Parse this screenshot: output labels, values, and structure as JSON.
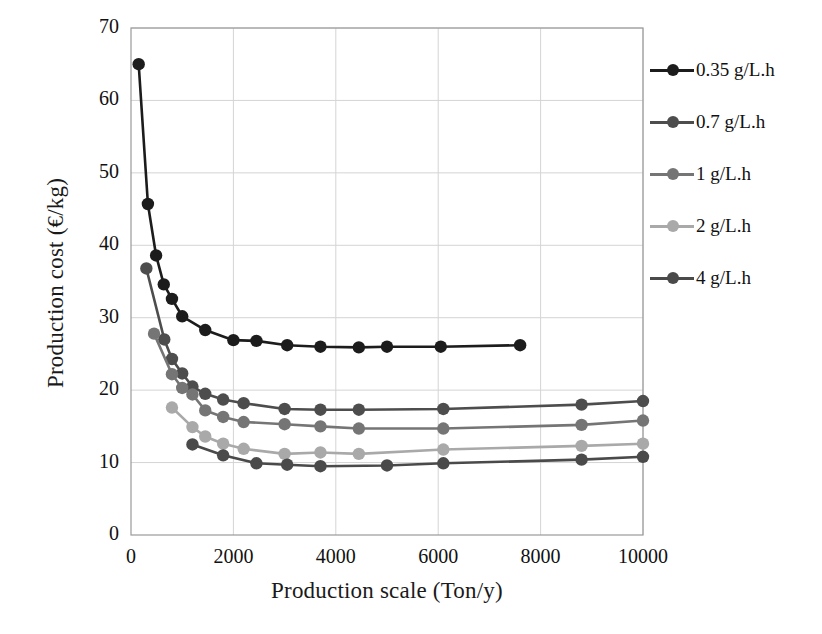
{
  "chart_data": {
    "type": "line",
    "title": "",
    "xlabel": "Production scale (Ton/y)",
    "ylabel": "Production cost (€/kg)",
    "xlim": [
      0,
      10000
    ],
    "ylim": [
      0,
      70
    ],
    "xticks": [
      0,
      2000,
      4000,
      6000,
      8000,
      10000
    ],
    "yticks": [
      0,
      10,
      20,
      30,
      40,
      50,
      60,
      70
    ],
    "grid": true,
    "legend_position": "right",
    "series": [
      {
        "name": "0.35 g/L.h",
        "color": "#1c1c1c",
        "x": [
          150,
          330,
          490,
          640,
          800,
          1000,
          1450,
          2000,
          2450,
          3050,
          3700,
          4450,
          5000,
          6050,
          7600
        ],
        "y": [
          65.0,
          45.7,
          38.6,
          34.6,
          32.6,
          30.2,
          28.3,
          26.9,
          26.8,
          26.2,
          26.0,
          25.9,
          26.0,
          26.0,
          26.2
        ]
      },
      {
        "name": "0.7 g/L.h",
        "color": "#4d4d4d",
        "x": [
          300,
          650,
          800,
          1000,
          1200,
          1450,
          1800,
          2200,
          3000,
          3700,
          4450,
          6100,
          8800,
          10000
        ],
        "y": [
          36.8,
          27.0,
          24.3,
          22.3,
          20.5,
          19.5,
          18.7,
          18.2,
          17.4,
          17.3,
          17.3,
          17.4,
          18.0,
          18.5
        ]
      },
      {
        "name": "1 g/L.h",
        "color": "#757575",
        "x": [
          450,
          800,
          1000,
          1200,
          1450,
          1800,
          2200,
          3000,
          3700,
          4450,
          6100,
          8800,
          10000
        ],
        "y": [
          27.8,
          22.2,
          20.3,
          19.4,
          17.2,
          16.3,
          15.6,
          15.3,
          15.0,
          14.7,
          14.7,
          15.2,
          15.8
        ]
      },
      {
        "name": "2 g/L.h",
        "color": "#a9a9a9",
        "x": [
          800,
          1200,
          1450,
          1800,
          2200,
          3000,
          3700,
          4450,
          6100,
          8800,
          10000
        ],
        "y": [
          17.6,
          14.9,
          13.6,
          12.6,
          11.9,
          11.2,
          11.4,
          11.2,
          11.8,
          12.3,
          12.6
        ]
      },
      {
        "name": "4 g/L.h",
        "color": "#4a4a4a",
        "x": [
          1200,
          1800,
          2450,
          3050,
          3700,
          5000,
          6100,
          8800,
          10000
        ],
        "y": [
          12.5,
          11.0,
          9.9,
          9.7,
          9.5,
          9.6,
          9.9,
          10.4,
          10.8
        ]
      }
    ]
  },
  "axes": {
    "x_title": "Production scale (Ton/y)",
    "y_title": "Production cost (€/kg)",
    "x_tick_labels": [
      "0",
      "2000",
      "4000",
      "6000",
      "8000",
      "10000"
    ],
    "y_tick_labels": [
      "0",
      "10",
      "20",
      "30",
      "40",
      "50",
      "60",
      "70"
    ]
  },
  "legend": {
    "items": [
      {
        "label": "0.35 g/L.h",
        "color": "#1c1c1c"
      },
      {
        "label": "0.7 g/L.h",
        "color": "#4d4d4d"
      },
      {
        "label": "1 g/L.h",
        "color": "#757575"
      },
      {
        "label": "2 g/L.h",
        "color": "#a9a9a9"
      },
      {
        "label": "4 g/L.h",
        "color": "#4a4a4a"
      }
    ]
  }
}
